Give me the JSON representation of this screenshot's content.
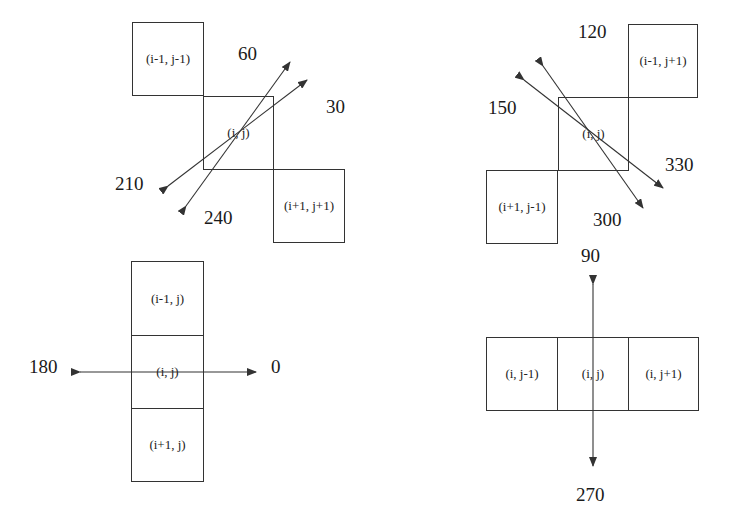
{
  "diagrams": {
    "diag_60_30": {
      "cells": [
        "(i-1, j-1)",
        "(i, j)",
        "(i+1, j+1)"
      ],
      "angles": [
        "60",
        "30",
        "210",
        "240"
      ]
    },
    "diag_120_150": {
      "cells": [
        "(i-1, j+1)",
        "(i, j)",
        "(i+1, j-1)"
      ],
      "angles": [
        "120",
        "150",
        "330",
        "300"
      ]
    },
    "horizontal": {
      "cells": [
        "(i-1, j)",
        "(i, j)",
        "(i+1, j)"
      ],
      "angles": [
        "180",
        "0"
      ]
    },
    "vertical": {
      "cells": [
        "(i, j-1)",
        "(i, j)",
        "(i, j+1)"
      ],
      "angles": [
        "90",
        "270"
      ]
    }
  },
  "colors": {
    "line": "#333333",
    "text": "#1a1a1a",
    "background": "#ffffff"
  }
}
